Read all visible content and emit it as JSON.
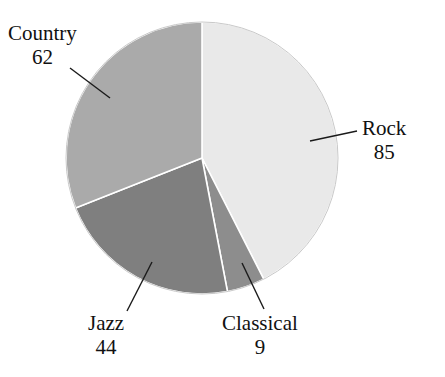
{
  "chart_data": {
    "type": "pie",
    "title": "",
    "subtitle": "",
    "xlabel": "",
    "ylabel": "",
    "legend_position": "none",
    "grid": false,
    "total": 200,
    "categories": [
      "Rock",
      "Classical",
      "Jazz",
      "Country"
    ],
    "values": [
      85,
      9,
      44,
      62
    ],
    "slices": [
      {
        "label": "Rock",
        "value": "85",
        "value_number": 85,
        "percent": 42.5,
        "color": "#e9e9e9",
        "start_angle_deg": 0,
        "end_angle_deg": 153,
        "leader_line": {
          "x1": 310,
          "y1": 141,
          "x2": 357,
          "y2": 131
        }
      },
      {
        "label": "Classical",
        "value": "9",
        "value_number": 9,
        "percent": 4.5,
        "color": "#8d8d8d",
        "start_angle_deg": 153,
        "end_angle_deg": 169.2,
        "leader_line": {
          "x1": 242,
          "y1": 263,
          "x2": 264,
          "y2": 309
        }
      },
      {
        "label": "Jazz",
        "value": "44",
        "value_number": 44,
        "percent": 22.0,
        "color": "#7f7f7f",
        "start_angle_deg": 169.2,
        "end_angle_deg": 248.4,
        "leader_line": {
          "x1": 152,
          "y1": 262,
          "x2": 127,
          "y2": 311
        }
      },
      {
        "label": "Country",
        "value": "62",
        "value_number": 62,
        "percent": 31.0,
        "color": "#aaaaaa",
        "start_angle_deg": 248.4,
        "end_angle_deg": 360,
        "leader_line": {
          "x1": 110,
          "y1": 98,
          "x2": 70,
          "y2": 68
        }
      }
    ],
    "geometry": {
      "center_x": 202,
      "center_y": 158,
      "radius": 136
    },
    "colors": {
      "background": "#ffffff",
      "separator": "#ffffff",
      "outline": "#c9c9c9",
      "text": "#111111",
      "leader": "#1a1a1a"
    }
  }
}
